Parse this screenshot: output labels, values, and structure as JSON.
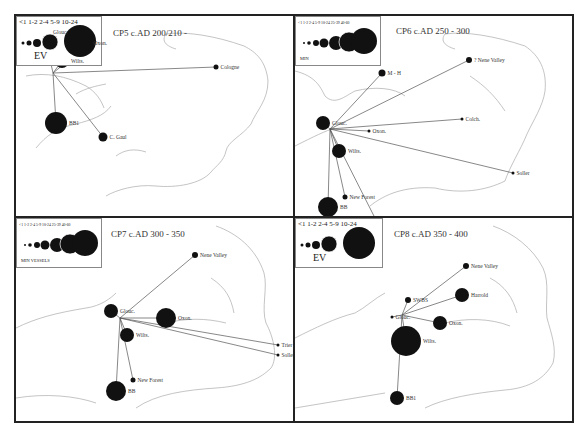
{
  "figure": {
    "panels": [
      {
        "id": "CP5",
        "title": "CP5 c.AD 200/210 -",
        "legend": {
          "size_labels": "<1  1-2  2-4  5-9  10-24",
          "unit_label": "EV"
        },
        "sites": [
          {
            "name": "Glouc.",
            "x": 28,
            "y": 16,
            "r": 7
          },
          {
            "name": "Oxon.",
            "x": 74,
            "y": 27,
            "r": 1.5
          },
          {
            "name": "Wilts.",
            "x": 46,
            "y": 45,
            "r": 7
          },
          {
            "name": "Cologne",
            "x": 200,
            "y": 51,
            "r": 2.5
          },
          {
            "name": "BB1",
            "x": 40,
            "y": 107,
            "r": 11
          },
          {
            "name": "C. Gaul",
            "x": 87,
            "y": 121,
            "r": 4.5
          }
        ]
      },
      {
        "id": "CP6",
        "title": "CP6 c.AD 250 - 300",
        "legend": {
          "size_labels": "<1 1-2 2-4 5-9 10-24 25-39 40-60",
          "unit_label": "MIN"
        },
        "sites": [
          {
            "name": "M - H",
            "x": 87,
            "y": 57,
            "r": 3.5
          },
          {
            "name": "? Nene Valley",
            "x": 174,
            "y": 44,
            "r": 3
          },
          {
            "name": "Glouc.",
            "x": 28,
            "y": 107,
            "r": 7
          },
          {
            "name": "Oxon.",
            "x": 74,
            "y": 115,
            "r": 1.5
          },
          {
            "name": "Colch.",
            "x": 167,
            "y": 103,
            "r": 1.5
          },
          {
            "name": "Wilts.",
            "x": 44,
            "y": 135,
            "r": 7
          },
          {
            "name": "Soller",
            "x": 218,
            "y": 157,
            "r": 1.5
          },
          {
            "name": "New Forest",
            "x": 50,
            "y": 181,
            "r": 2.5
          },
          {
            "name": "BB",
            "x": 33,
            "y": 191,
            "r": 10
          },
          {
            "name": "C. Gaul",
            "x": 84,
            "y": 210,
            "r": 2.5
          }
        ]
      },
      {
        "id": "CP7",
        "title": "CP7 c.AD 300 - 350",
        "legend": {
          "size_labels": "<1 1-2 2-4 5-9 10-24 25-39 40-60",
          "unit_label": "MIN VESSELS"
        },
        "sites": [
          {
            "name": "Nene Valley",
            "x": 179,
            "y": 37,
            "r": 3
          },
          {
            "name": "Glouc.",
            "x": 95,
            "y": 93,
            "r": 7
          },
          {
            "name": "Oxon.",
            "x": 150,
            "y": 100,
            "r": 10
          },
          {
            "name": "Wilts.",
            "x": 111,
            "y": 117,
            "r": 7
          },
          {
            "name": "Trier",
            "x": 262,
            "y": 127,
            "r": 1.5
          },
          {
            "name": "Soller",
            "x": 262,
            "y": 137,
            "r": 1.5
          },
          {
            "name": "New Forest",
            "x": 117,
            "y": 162,
            "r": 2.5
          },
          {
            "name": "BB",
            "x": 100,
            "y": 173,
            "r": 10
          }
        ]
      },
      {
        "id": "CP8",
        "title": "CP8 c.AD 350 - 400",
        "legend": {
          "size_labels": "<1  1-2  2-4  5-9  10-24",
          "unit_label": "EV"
        },
        "sites": [
          {
            "name": "Nene Valley",
            "x": 171,
            "y": 48,
            "r": 3
          },
          {
            "name": "Harrold",
            "x": 167,
            "y": 77,
            "r": 7
          },
          {
            "name": "SWBS",
            "x": 113,
            "y": 82,
            "r": 3
          },
          {
            "name": "Glouc.",
            "x": 97,
            "y": 99,
            "r": 1.5
          },
          {
            "name": "Oxon.",
            "x": 145,
            "y": 105,
            "r": 7
          },
          {
            "name": "Wilts.",
            "x": 111,
            "y": 123,
            "r": 15
          },
          {
            "name": "BB1",
            "x": 102,
            "y": 180,
            "r": 7
          }
        ]
      }
    ]
  }
}
